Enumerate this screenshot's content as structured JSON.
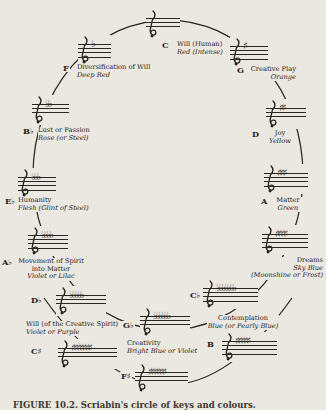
{
  "figure": {
    "caption": "FIGURE 10.2. Scriabin's circle of keys and colours."
  },
  "colors": {
    "paper": "#ebe8e2",
    "ink": "#26231d"
  },
  "stations": [
    {
      "key": "C",
      "signature": "",
      "quality": "Will (Human)",
      "color": "Red (Intense)"
    },
    {
      "key": "G",
      "signature": "♯",
      "quality": "Creative Play",
      "color": "Orange"
    },
    {
      "key": "D",
      "signature": "♯♯",
      "quality": "Joy",
      "color": "Yellow"
    },
    {
      "key": "A",
      "signature": "♯♯♯",
      "quality": "Matter",
      "color": "Green"
    },
    {
      "key": "E",
      "signature": "♯♯♯♯",
      "quality": "Dreams",
      "color": "Sky Blue",
      "color2": "(Moonshine or Frost)"
    },
    {
      "key": "C♭",
      "signature": "♭♭♭♭♭♭♭",
      "quality": "Contemplation",
      "color": "Blue (or Pearly Blue)"
    },
    {
      "key": "B",
      "signature": "♯♯♯♯♯"
    },
    {
      "key": "F♯",
      "signature": "♯♯♯♯♯♯"
    },
    {
      "key": "G♭",
      "signature": "♭♭♭♭♭♭",
      "quality": "Creativity",
      "color": "Bright Blue or Violet"
    },
    {
      "key": "C♯",
      "signature": "♯♯♯♯♯♯♯"
    },
    {
      "key": "D♭",
      "signature": "♭♭♭♭♭",
      "quality": "Will (of the Creative Spirit)",
      "color": "Violet or Purple"
    },
    {
      "key": "A♭",
      "signature": "♭♭♭♭",
      "quality": "Movement of Spirit",
      "quality2": "into Matter",
      "color": "Violet or Lilac"
    },
    {
      "key": "E♭",
      "signature": "♭♭♭",
      "quality": "Humanity",
      "color": "Flesh (Glint of Steel)"
    },
    {
      "key": "B♭",
      "signature": "♭♭",
      "quality": "Lust or Passion",
      "color": "Rose (or Steel)"
    },
    {
      "key": "F",
      "signature": "♭",
      "quality": "Diversification of Will",
      "color": "Deep Red"
    }
  ]
}
